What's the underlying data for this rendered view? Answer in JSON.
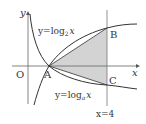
{
  "diagram": {
    "axes": {
      "x_label": "x",
      "y_label": "y",
      "origin_label": "O"
    },
    "curves": [
      {
        "name": "log2",
        "label_prefix": "y=log",
        "label_base": "2",
        "label_var": "x"
      },
      {
        "name": "loga",
        "label_prefix": "y=log",
        "label_base": "a",
        "label_var": "x"
      }
    ],
    "points": {
      "A": "A",
      "B": "B",
      "C": "C"
    },
    "vertical_line_label": "x=4",
    "shaded_region": "triangle ABC",
    "colors": {
      "line": "#333333",
      "shade": "#d3d3d3",
      "axis": "#666666"
    }
  }
}
